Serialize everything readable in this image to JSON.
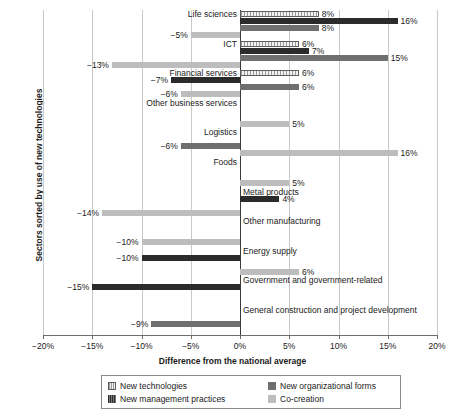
{
  "chart_data": {
    "type": "bar",
    "orientation": "horizontal",
    "title": "",
    "xlabel": "Difference from the national average",
    "ylabel": "Sectors sorted by use of new technologies",
    "xlim": [
      -20,
      20
    ],
    "xticks": [
      "−20%",
      "−15%",
      "−10%",
      "−5%",
      "0%",
      "5%",
      "10%",
      "15%",
      "20%"
    ],
    "xtick_values": [
      -20,
      -15,
      -10,
      -5,
      0,
      5,
      10,
      15,
      20
    ],
    "grid": true,
    "legend_position": "bottom",
    "categories": [
      "Life sciences",
      "ICT",
      "Financial services",
      "Other business services",
      "Logistics",
      "Foods",
      "Metal products",
      "Other manufacturing",
      "Energy supply",
      "Government and government-related",
      "General construction and project development"
    ],
    "series": [
      {
        "name": "New technologies",
        "key": "tech",
        "color": "#f2f2f2",
        "values": [
          8,
          6,
          6,
          0,
          0,
          0,
          0,
          0,
          0,
          0,
          0
        ],
        "labels": [
          "8%",
          "6%",
          "6%",
          "",
          "",
          "",
          "",
          "",
          "",
          "",
          ""
        ]
      },
      {
        "name": "New management practices",
        "key": "mgmt",
        "color": "#2b2b2b",
        "values": [
          16,
          7,
          -7,
          0,
          0,
          0,
          4,
          0,
          -10,
          -15,
          0
        ],
        "labels": [
          "16%",
          "7%",
          "−7%",
          "",
          "",
          "",
          "4%",
          "",
          "−10%",
          "−15%",
          ""
        ]
      },
      {
        "name": "New organizational forms",
        "key": "org",
        "color": "#6f6f6f",
        "values": [
          8,
          15,
          6,
          0,
          -6,
          0,
          0,
          0,
          0,
          0,
          -9
        ],
        "labels": [
          "8%",
          "15%",
          "6%",
          "",
          "−6%",
          "",
          "",
          "",
          "",
          "",
          "−9%"
        ]
      },
      {
        "name": "Co-creation",
        "key": "cocr",
        "color": "#bdbdbd",
        "values": [
          -5,
          -13,
          -6,
          5,
          16,
          5,
          -14,
          -10,
          6,
          0,
          0
        ],
        "labels": [
          "−5%",
          "−13%",
          "−6%",
          "5%",
          "16%",
          "5%",
          "−14%",
          "−10%",
          "6%",
          "",
          ""
        ]
      }
    ],
    "category_label_side": [
      "left",
      "left",
      "left",
      "left",
      "left",
      "left",
      "right",
      "right",
      "right",
      "right",
      "right"
    ]
  },
  "legend": {
    "items": [
      {
        "label": "New technologies",
        "key": "tech"
      },
      {
        "label": "New organizational forms",
        "key": "org"
      },
      {
        "label": "New management practices",
        "key": "mgmt"
      },
      {
        "label": "Co-creation",
        "key": "cocr"
      }
    ]
  }
}
